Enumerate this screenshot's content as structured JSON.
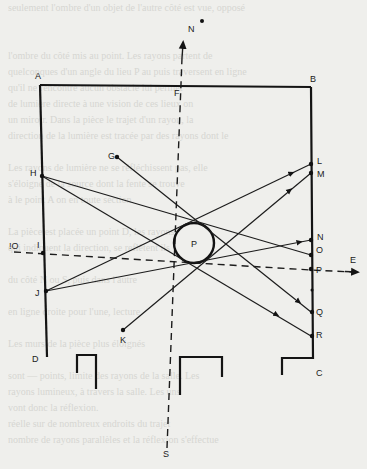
{
  "diagram": {
    "labels": {
      "A": "A",
      "B": "B",
      "C": "C",
      "D": "D",
      "E": "E",
      "F": "F",
      "G": "G",
      "H": "H",
      "I": "I",
      "J": "J",
      "K": "K",
      "L": "L",
      "M": "M",
      "N_wall": "N",
      "O_wall": "O",
      "P_wall": "P",
      "Q": "Q",
      "R": "R",
      "S": "S",
      "N_compass": "N",
      "O_west": "!O",
      "P_center": "P"
    },
    "elements": {
      "room": "rectangular room A-B-C-D with openings at the bottom",
      "obstacle": "circular pillar P",
      "north_south_axis": "dashed line N-S through F",
      "east_west_axis": "dashed line O-E through I and P",
      "rays": [
        {
          "from": "G",
          "to": "Q",
          "via": "top of pillar"
        },
        {
          "from": "H",
          "to": "O",
          "via": "top of pillar"
        },
        {
          "from": "H",
          "to": "R",
          "via": "bottom of pillar"
        },
        {
          "from": "J",
          "to": "L",
          "via": "top of pillar"
        },
        {
          "from": "J",
          "to": "N",
          "via": "bottom of pillar"
        },
        {
          "from": "K",
          "to": "M",
          "via": "bottom of pillar"
        }
      ]
    },
    "colors": {
      "ink": "#141414",
      "paper": "#efefec",
      "bleed_through": "#d6d6d2"
    }
  },
  "bleed_through_text": [
    "seulement l'ombre d'un objet de l'autre côté est vue, opposé",
    "",
    "",
    "l'ombre du côté mis au point. Les rayons partent de",
    "quelconques d'un angle du lieu P au puis traversent en ligne",
    "qu'il ne rencontre aucun obstacle lui permet",
    "de lumière directe à une vision de ces lieux on",
    "un miroir. Dans la pièce le trajet d'un rayon, la",
    "direction de la lumière est tracée par des rayons dont le",
    "",
    "Les rayons de lumière ne se réfléchissent pas, elle",
    "s'éloigne de la source dont la fente se trouve",
    "à le point A on en toute section.",
    "",
    "La pièce est placée un point D, les rayons",
    "qui indiquent la direction, se reflètent ils",
    "",
    "du côté N ou S, puis dans l'autre",
    "",
    "en ligne droite pour l'une, lecture",
    "",
    "Les murs de la pièce plus éloignés",
    "",
    "sont — points, limite des rayons de la salle. Les",
    "rayons lumineux, à travers la salle. Les uns",
    "vont donc la réflexion.",
    "réelle sur de nombreux endroits du trajet",
    "nombre de rayons parallèles et la réflexion s'effectue"
  ]
}
